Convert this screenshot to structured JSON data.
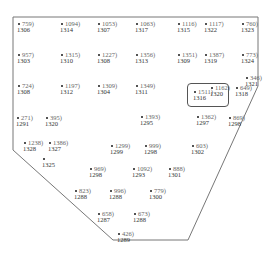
{
  "diagram": {
    "type": "lot-plan",
    "boundary_points": [
      [
        13,
        17
      ],
      [
        258,
        17
      ],
      [
        258,
        86
      ],
      [
        188,
        240
      ],
      [
        113,
        240
      ],
      [
        13,
        150
      ]
    ],
    "highlight": {
      "label": "1511",
      "id": "1316",
      "x": 187,
      "y": 83,
      "w": 40,
      "h": 22
    },
    "spots": [
      {
        "val": "759",
        "id": "1306",
        "x": 17,
        "y": 20
      },
      {
        "val": "1094",
        "id": "1314",
        "x": 60,
        "y": 20
      },
      {
        "val": "1053",
        "id": "1307",
        "x": 97,
        "y": 20
      },
      {
        "val": "1063",
        "id": "1317",
        "x": 135,
        "y": 20
      },
      {
        "val": "1116",
        "id": "1315",
        "x": 177,
        "y": 20
      },
      {
        "val": "1117",
        "id": "1322",
        "x": 204,
        "y": 20
      },
      {
        "val": "760",
        "id": "1323",
        "x": 241,
        "y": 20
      },
      {
        "val": "957",
        "id": "1303",
        "x": 17,
        "y": 51
      },
      {
        "val": "1315",
        "id": "1310",
        "x": 60,
        "y": 51
      },
      {
        "val": "1227",
        "id": "1308",
        "x": 97,
        "y": 51
      },
      {
        "val": "1356",
        "id": "1313",
        "x": 135,
        "y": 51
      },
      {
        "val": "1351",
        "id": "1309",
        "x": 177,
        "y": 51
      },
      {
        "val": "1387",
        "id": "1319",
        "x": 204,
        "y": 51
      },
      {
        "val": "773",
        "id": "1324",
        "x": 241,
        "y": 51
      },
      {
        "val": "724",
        "id": "1308",
        "x": 17,
        "y": 82
      },
      {
        "val": "1197",
        "id": "1312",
        "x": 60,
        "y": 82
      },
      {
        "val": "1309",
        "id": "1304",
        "x": 97,
        "y": 82
      },
      {
        "val": "1349",
        "id": "1311",
        "x": 135,
        "y": 82
      },
      {
        "val": "1162",
        "id": "1320",
        "x": 210,
        "y": 84
      },
      {
        "val": "346",
        "id": "1321",
        "x": 245,
        "y": 74
      },
      {
        "val": "649",
        "id": "1318",
        "x": 235,
        "y": 84
      },
      {
        "val": "271",
        "id": "1291",
        "x": 16,
        "y": 114
      },
      {
        "val": "395",
        "id": "1320",
        "x": 45,
        "y": 114
      },
      {
        "val": "1393",
        "id": "1295",
        "x": 140,
        "y": 113
      },
      {
        "val": "1362",
        "id": "1297",
        "x": 196,
        "y": 113
      },
      {
        "val": "869",
        "id": "1298",
        "x": 228,
        "y": 114
      },
      {
        "val": "1238",
        "id": "1328",
        "x": 23,
        "y": 139
      },
      {
        "val": "1386",
        "id": "1327",
        "x": 48,
        "y": 139
      },
      {
        "val": "1299",
        "id": "1299",
        "x": 110,
        "y": 142
      },
      {
        "val": "999",
        "id": "1298",
        "x": 144,
        "y": 142
      },
      {
        "val": "603",
        "id": "1302",
        "x": 191,
        "y": 142
      },
      {
        "val": "",
        "id": "1325",
        "x": 42,
        "y": 155
      },
      {
        "val": "969",
        "id": "1298",
        "x": 89,
        "y": 165
      },
      {
        "val": "1092",
        "id": "1293",
        "x": 132,
        "y": 165
      },
      {
        "val": "888",
        "id": "1301",
        "x": 168,
        "y": 165
      },
      {
        "val": "823",
        "id": "1288",
        "x": 74,
        "y": 187
      },
      {
        "val": "996",
        "id": "1288",
        "x": 109,
        "y": 187
      },
      {
        "val": "779",
        "id": "1300",
        "x": 149,
        "y": 187
      },
      {
        "val": "658",
        "id": "1287",
        "x": 97,
        "y": 210
      },
      {
        "val": "673",
        "id": "1288",
        "x": 133,
        "y": 210
      },
      {
        "val": "426",
        "id": "1289",
        "x": 117,
        "y": 230
      }
    ]
  }
}
